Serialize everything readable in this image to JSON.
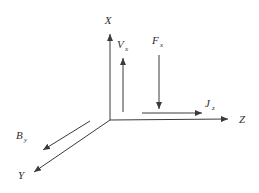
{
  "diagram": {
    "background_color": "#ffffff",
    "line_color": "#3a3a3a",
    "text_color": "#2e2e2e",
    "axes": [
      {
        "label": "X",
        "direction": "up"
      },
      {
        "label": "Y",
        "direction": "down-left"
      },
      {
        "label": "Z",
        "direction": "right"
      }
    ],
    "vectors": [
      {
        "base": "V",
        "sub": "x",
        "direction": "up",
        "parallel_to": "+X"
      },
      {
        "base": "F",
        "sub": "x",
        "direction": "down",
        "parallel_to": "-X"
      },
      {
        "base": "J",
        "sub": "z",
        "direction": "right",
        "parallel_to": "+Z"
      },
      {
        "base": "B",
        "sub": "y",
        "direction": "down-left",
        "parallel_to": "+Y"
      }
    ]
  }
}
